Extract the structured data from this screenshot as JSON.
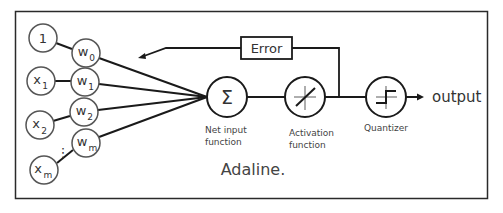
{
  "diagram": {
    "title": "Adaline.",
    "inputs": [
      {
        "id": "bias",
        "label": "1",
        "sub": ""
      },
      {
        "id": "x1",
        "label": "x",
        "sub": "1"
      },
      {
        "id": "x2",
        "label": "x",
        "sub": "2"
      },
      {
        "id": "xm",
        "label": "x",
        "sub": "m"
      }
    ],
    "weights": [
      {
        "id": "w0",
        "label": "w",
        "sub": "0"
      },
      {
        "id": "w1",
        "label": "w",
        "sub": "1"
      },
      {
        "id": "w2",
        "label": "w",
        "sub": "2"
      },
      {
        "id": "wm",
        "label": "w",
        "sub": "m"
      }
    ],
    "ellipsis": "⋮",
    "net_input": {
      "symbol": "Σ",
      "caption_line1": "Net input",
      "caption_line2": "function"
    },
    "activation": {
      "caption_line1": "Activation",
      "caption_line2": "function"
    },
    "quantizer": {
      "caption": "Quantizer"
    },
    "error_label": "Error",
    "output_label": "output",
    "colors": {
      "stroke": "#1a1a1a",
      "text": "#333333",
      "background": "#ffffff"
    }
  }
}
